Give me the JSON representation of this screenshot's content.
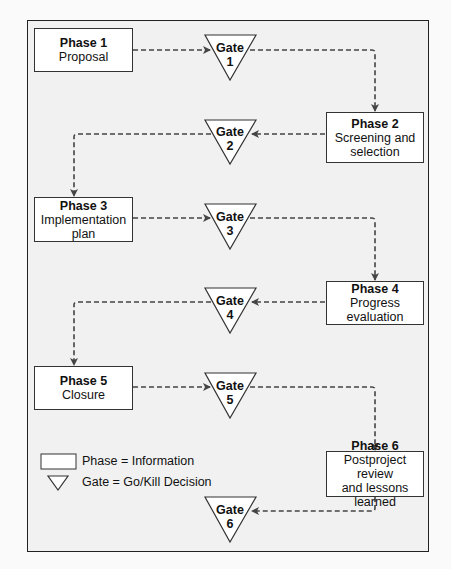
{
  "diagram": {
    "type": "phase-gate-process",
    "phases": [
      {
        "id": 1,
        "title": "Phase 1",
        "lines": [
          "Proposal"
        ]
      },
      {
        "id": 2,
        "title": "Phase 2",
        "lines": [
          "Screening and",
          "selection"
        ]
      },
      {
        "id": 3,
        "title": "Phase 3",
        "lines": [
          "Implementation",
          "plan"
        ]
      },
      {
        "id": 4,
        "title": "Phase 4",
        "lines": [
          "Progress evaluation"
        ]
      },
      {
        "id": 5,
        "title": "Phase 5",
        "lines": [
          "Closure"
        ]
      },
      {
        "id": 6,
        "title": "Phase 6",
        "lines": [
          "Postproject review",
          "and lessons learned"
        ]
      }
    ],
    "gates": [
      {
        "id": 1,
        "label": "Gate",
        "number": "1"
      },
      {
        "id": 2,
        "label": "Gate",
        "number": "2"
      },
      {
        "id": 3,
        "label": "Gate",
        "number": "3"
      },
      {
        "id": 4,
        "label": "Gate",
        "number": "4"
      },
      {
        "id": 5,
        "label": "Gate",
        "number": "5"
      },
      {
        "id": 6,
        "label": "Gate",
        "number": "6"
      }
    ],
    "flow": [
      "Phase 1",
      "Gate 1",
      "Phase 2",
      "Gate 2",
      "Phase 3",
      "Gate 3",
      "Phase 4",
      "Gate 4",
      "Phase 5",
      "Gate 5",
      "Phase 6",
      "Gate 6"
    ],
    "legend": {
      "phase": "Phase = Information",
      "gate": "Gate = Go/Kill Decision"
    },
    "colors": {
      "frame_bg": "#f1f1f1",
      "box_bg": "#ffffff",
      "stroke": "#333333",
      "arrow": "#444444"
    }
  }
}
